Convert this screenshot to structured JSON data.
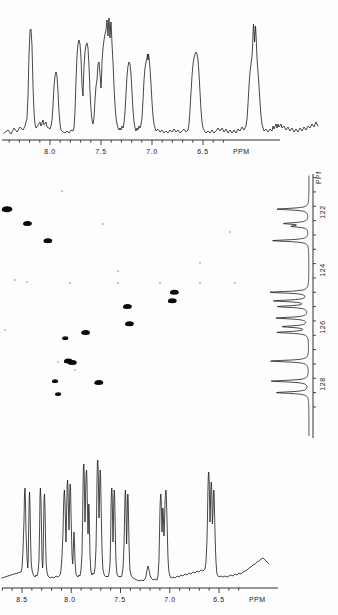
{
  "figure": {
    "title": "",
    "type": "2D heteronuclear shift correlation NMR spectrum"
  },
  "top_spectrum": {
    "name": "1H NMR projection (top)",
    "axis_label": "PPM",
    "ticks": [
      {
        "value": "8.0",
        "x": 50
      },
      {
        "value": "7.5",
        "x": 101
      },
      {
        "value": "7.0",
        "x": 152
      },
      {
        "value": "6.5",
        "x": 203
      }
    ],
    "ppm_label_x": 233,
    "axis_range": [
      8.65,
      6.25
    ],
    "minor_tick_step_ppm": 0.1
  },
  "bottom_spectrum": {
    "name": "1H NMR spectrum (bottom)",
    "axis_label": "PPM",
    "ticks": [
      {
        "value": "8.5",
        "x": 22
      },
      {
        "value": "8.0",
        "x": 70
      },
      {
        "value": "7.5",
        "x": 120
      },
      {
        "value": "7.0",
        "x": 170
      },
      {
        "value": "6.5",
        "x": 219
      }
    ],
    "ppm_label_x": 249,
    "axis_range": [
      8.62,
      6.25
    ],
    "minor_tick_step_ppm": 0.1
  },
  "carbon_axis": {
    "name": "13C chemical shift axis",
    "axis_label": "PPM",
    "ppm_label_y": 12,
    "ticks": [
      {
        "value": "122",
        "y": 40
      },
      {
        "value": "124",
        "y": 98
      },
      {
        "value": "126",
        "y": 155
      },
      {
        "value": "128",
        "y": 212
      }
    ],
    "axis_range": [
      120.8,
      129.2
    ],
    "minor_tick_step_ppm": 0.5
  },
  "chart_data": {
    "type": "line",
    "xlabel": "PPM",
    "ylabel": "PPM",
    "grid": false,
    "legend": "none",
    "xlim": [
      8.65,
      6.25
    ],
    "ylim": [
      129.2,
      120.8
    ],
    "top_trace": {
      "name": "1H projection trace",
      "xlim": [
        8.65,
        6.25
      ],
      "peaks_ppm": [
        {
          "shift": 8.43,
          "intensity": 0.86
        },
        {
          "shift": 8.31,
          "intensity": 0.12
        },
        {
          "shift": 8.22,
          "intensity": 0.44
        },
        {
          "shift": 8.03,
          "intensity": 0.72
        },
        {
          "shift": 7.96,
          "intensity": 0.7
        },
        {
          "shift": 7.87,
          "intensity": 0.8
        },
        {
          "shift": 7.82,
          "intensity": 0.95
        },
        {
          "shift": 7.79,
          "intensity": 0.99
        },
        {
          "shift": 7.6,
          "intensity": 0.52
        },
        {
          "shift": 7.45,
          "intensity": 0.58
        },
        {
          "shift": 7.42,
          "intensity": 0.5
        },
        {
          "shift": 7.14,
          "intensity": 0.86
        },
        {
          "shift": 6.58,
          "intensity": 0.94
        },
        {
          "shift": 6.55,
          "intensity": 0.82
        }
      ]
    },
    "bottom_trace": {
      "name": "1H 1D spectrum trace",
      "xlim": [
        8.62,
        6.25
      ],
      "peaks_ppm": [
        {
          "shift": 8.47,
          "intensity": 0.5
        },
        {
          "shift": 8.44,
          "intensity": 0.48
        },
        {
          "shift": 8.31,
          "intensity": 0.5
        },
        {
          "shift": 8.28,
          "intensity": 0.47
        },
        {
          "shift": 8.09,
          "intensity": 0.52
        },
        {
          "shift": 8.06,
          "intensity": 0.62
        },
        {
          "shift": 8.03,
          "intensity": 0.55
        },
        {
          "shift": 7.98,
          "intensity": 0.9
        },
        {
          "shift": 7.95,
          "intensity": 0.78
        },
        {
          "shift": 7.92,
          "intensity": 0.45
        },
        {
          "shift": 7.88,
          "intensity": 0.99
        },
        {
          "shift": 7.85,
          "intensity": 0.55
        },
        {
          "shift": 7.7,
          "intensity": 0.52
        },
        {
          "shift": 7.67,
          "intensity": 0.45
        },
        {
          "shift": 7.57,
          "intensity": 0.53
        },
        {
          "shift": 7.54,
          "intensity": 0.48
        },
        {
          "shift": 7.23,
          "intensity": 0.52
        },
        {
          "shift": 7.2,
          "intensity": 0.56
        },
        {
          "shift": 6.75,
          "intensity": 0.8
        },
        {
          "shift": 6.71,
          "intensity": 0.66
        },
        {
          "shift": 6.68,
          "intensity": 0.6
        }
      ]
    },
    "carbon_trace": {
      "name": "13C 1D trace (right side)",
      "ylim": [
        120.8,
        129.2
      ],
      "peaks_ppm": [
        {
          "shift": 121.9,
          "intensity": 0.62
        },
        {
          "shift": 122.4,
          "intensity": 0.46
        },
        {
          "shift": 122.5,
          "intensity": 0.3
        },
        {
          "shift": 123.0,
          "intensity": 0.7
        },
        {
          "shift": 124.8,
          "intensity": 0.74
        },
        {
          "shift": 125.1,
          "intensity": 0.66
        },
        {
          "shift": 125.3,
          "intensity": 0.58
        },
        {
          "shift": 125.7,
          "intensity": 0.62
        },
        {
          "shift": 126.0,
          "intensity": 0.5
        },
        {
          "shift": 126.2,
          "intensity": 0.6
        },
        {
          "shift": 127.2,
          "intensity": 0.74
        },
        {
          "shift": 127.9,
          "intensity": 0.72
        },
        {
          "shift": 128.3,
          "intensity": 0.62
        }
      ]
    },
    "cross_peaks": [
      {
        "h_ppm": 8.42,
        "c_ppm": 121.9,
        "size": "large"
      },
      {
        "h_ppm": 8.22,
        "c_ppm": 122.4,
        "size": "medium"
      },
      {
        "h_ppm": 8.02,
        "c_ppm": 123.0,
        "size": "medium"
      },
      {
        "h_ppm": 6.78,
        "c_ppm": 124.8,
        "size": "medium"
      },
      {
        "h_ppm": 6.8,
        "c_ppm": 125.1,
        "size": "medium"
      },
      {
        "h_ppm": 7.24,
        "c_ppm": 125.3,
        "size": "medium"
      },
      {
        "h_ppm": 7.22,
        "c_ppm": 125.9,
        "size": "medium"
      },
      {
        "h_ppm": 7.65,
        "c_ppm": 126.2,
        "size": "medium"
      },
      {
        "h_ppm": 7.85,
        "c_ppm": 126.4,
        "size": "small"
      },
      {
        "h_ppm": 7.82,
        "c_ppm": 127.2,
        "size": "medium"
      },
      {
        "h_ppm": 7.78,
        "c_ppm": 127.25,
        "size": "medium"
      },
      {
        "h_ppm": 7.95,
        "c_ppm": 127.9,
        "size": "small"
      },
      {
        "h_ppm": 7.52,
        "c_ppm": 127.95,
        "size": "medium"
      },
      {
        "h_ppm": 7.92,
        "c_ppm": 128.35,
        "size": "small"
      }
    ]
  }
}
